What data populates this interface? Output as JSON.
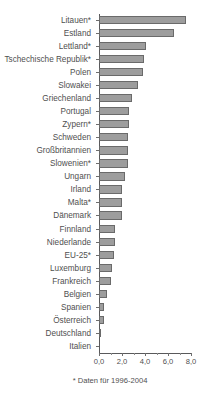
{
  "chart_data": {
    "type": "bar",
    "orientation": "horizontal",
    "title": "",
    "subtitle": "",
    "xlabel": "",
    "ylabel": "",
    "xlim": [
      0.0,
      8.0
    ],
    "xticks": [
      "0,0",
      "2,0",
      "4,0",
      "6,0",
      "8,0"
    ],
    "xtick_values": [
      0.0,
      2.0,
      4.0,
      6.0,
      8.0
    ],
    "grid": false,
    "legend": null,
    "footnote": "* Daten für 1996-2004",
    "categories": [
      "Litauen*",
      "Estland",
      "Lettland*",
      "Tschechische Republik*",
      "Polen",
      "Slowakei",
      "Griechenland",
      "Portugal",
      "Zypern*",
      "Schweden",
      "Großbritannien",
      "Slowenien*",
      "Ungarn",
      "Irland",
      "Malta*",
      "Dänemark",
      "Finnland",
      "Niederlande",
      "EU-25*",
      "Luxemburg",
      "Frankreich",
      "Belgien",
      "Spanien",
      "Österreich",
      "Deutschland",
      "Italien"
    ],
    "values": [
      7.6,
      6.5,
      4.1,
      3.9,
      3.8,
      3.4,
      2.9,
      2.6,
      2.6,
      2.5,
      2.5,
      2.5,
      2.3,
      2.0,
      2.0,
      2.0,
      1.4,
      1.4,
      1.3,
      1.1,
      1.0,
      0.7,
      0.4,
      0.4,
      0.15,
      0.0
    ]
  },
  "colors": {
    "bar_fill": "#9d9d9d",
    "bar_stroke": "#6a6a6a",
    "axis": "#59595b",
    "text": "#4f4f4f",
    "background": "#ffffff"
  }
}
